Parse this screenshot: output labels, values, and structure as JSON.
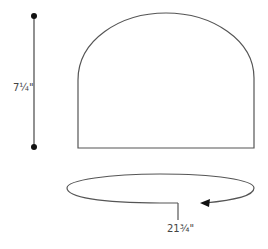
{
  "diagram": {
    "height_measurement": {
      "label": "7¼\""
    },
    "circumference_measurement": {
      "label": "21¾\""
    },
    "colors": {
      "stroke": "#555555",
      "dot": "#111111",
      "text": "#444444"
    }
  }
}
